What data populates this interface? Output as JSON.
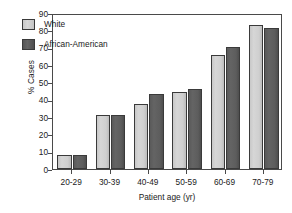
{
  "chart_data": {
    "type": "bar",
    "title": "",
    "subtitle": "",
    "xlabel": "Patient age (yr)",
    "ylabel": "% Cases",
    "categories": [
      "20-29",
      "30-39",
      "40-49",
      "50-59",
      "60-69",
      "70-79"
    ],
    "series": [
      {
        "name": "White",
        "color": "#cfcfcf",
        "values": [
          8.2,
          31.2,
          37.4,
          44.5,
          65.5,
          83.3
        ]
      },
      {
        "name": "African-American",
        "color": "#5a5a5a",
        "values": [
          8.2,
          31.2,
          43.0,
          46.0,
          70.3,
          81.3
        ]
      }
    ],
    "ylim": [
      0,
      90
    ],
    "ytick_step": 10,
    "yticks": [
      90,
      80,
      70,
      60,
      50,
      40,
      30,
      20,
      10,
      0
    ],
    "grid": false,
    "legend_position": "top-left",
    "legend_entries": [
      "White",
      "African-American"
    ]
  },
  "caption": {
    "text": ""
  }
}
